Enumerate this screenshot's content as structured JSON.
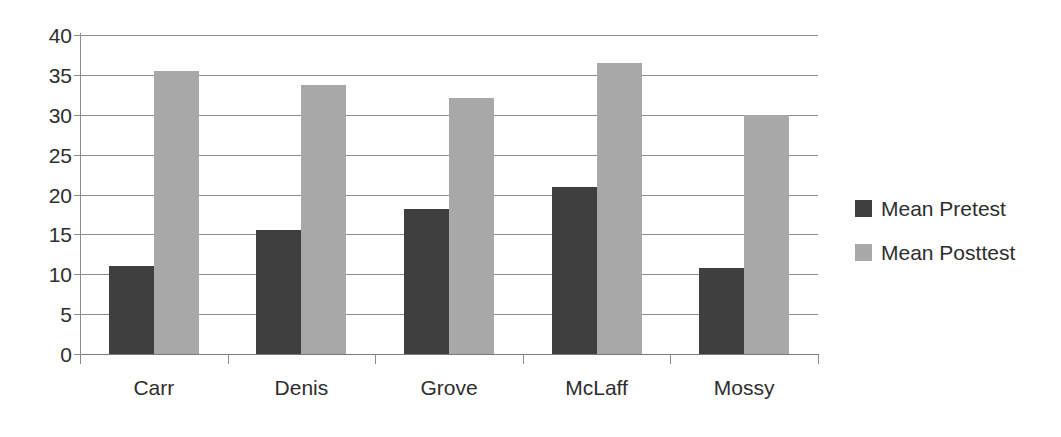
{
  "chart_data": {
    "type": "bar",
    "title": "",
    "subtitle": "",
    "xlabel": "",
    "ylabel": "",
    "categories": [
      "Carr",
      "Denis",
      "Grove",
      "McLaff",
      "Mossy"
    ],
    "series": [
      {
        "name": "Mean Pretest",
        "color": "#3f3f3f",
        "values": [
          11.0,
          15.5,
          18.2,
          21.0,
          10.8
        ]
      },
      {
        "name": "Mean Posttest",
        "color": "#a8a8a8",
        "values": [
          35.5,
          33.7,
          32.1,
          36.5,
          30.0
        ]
      }
    ],
    "ylim": [
      0,
      40
    ],
    "y_ticks": [
      0,
      5,
      10,
      15,
      20,
      25,
      30,
      35,
      40
    ],
    "y_tick_labels": [
      "0",
      "5",
      "10",
      "15",
      "20",
      "25",
      "30",
      "35",
      "40"
    ],
    "grid": true,
    "grid_axis": "y",
    "legend_position": "right",
    "background": "#ffffff",
    "grid_color": "#8c8c8c",
    "text_color": "#2e2e2e"
  },
  "legend": {
    "items": [
      {
        "label": "Mean Pretest",
        "swatch": "legend-swatch-pretest"
      },
      {
        "label": "Mean Posttest",
        "swatch": "legend-swatch-posttest"
      }
    ]
  }
}
